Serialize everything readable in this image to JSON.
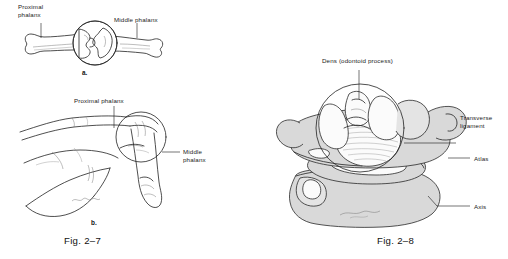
{
  "document": {
    "type": "anatomy-illustration-plate",
    "background_color": "#ffffff",
    "ink_color": "#1a1a1a",
    "shade_color": "#d9d9d9"
  },
  "figures": [
    {
      "id": "fig-2-7",
      "caption": "Fig. 2–7",
      "panels": [
        {
          "id": "panel-a",
          "letter": "a.",
          "subject": "Proximal interphalangeal joint, extended — bone outline view",
          "labels": [
            {
              "name": "proximal-phalanx",
              "text": "Proximal\nphalanx"
            },
            {
              "name": "middle-phalanx",
              "text": "Middle phalanx"
            }
          ]
        },
        {
          "id": "panel-b",
          "letter": "b.",
          "subject": "Finger flexed at proximal interphalangeal joint — surface view",
          "labels": [
            {
              "name": "proximal-phalanx",
              "text": "Proximal phalanx"
            },
            {
              "name": "middle-phalanx",
              "text": "Middle\nphalanx"
            }
          ]
        }
      ]
    },
    {
      "id": "fig-2-8",
      "caption": "Fig. 2–8",
      "panels": [
        {
          "id": "panel-atlas-axis",
          "letter": "",
          "subject": "Atlas and axis vertebrae, superior-oblique view showing dens and transverse ligament",
          "labels": [
            {
              "name": "dens-odontoid-process",
              "text": "Dens (odontoid process)"
            },
            {
              "name": "transverse-ligament",
              "text": "Transverse\nligament"
            },
            {
              "name": "atlas",
              "text": "Atlas"
            },
            {
              "name": "axis",
              "text": "Axis"
            }
          ]
        }
      ]
    }
  ]
}
